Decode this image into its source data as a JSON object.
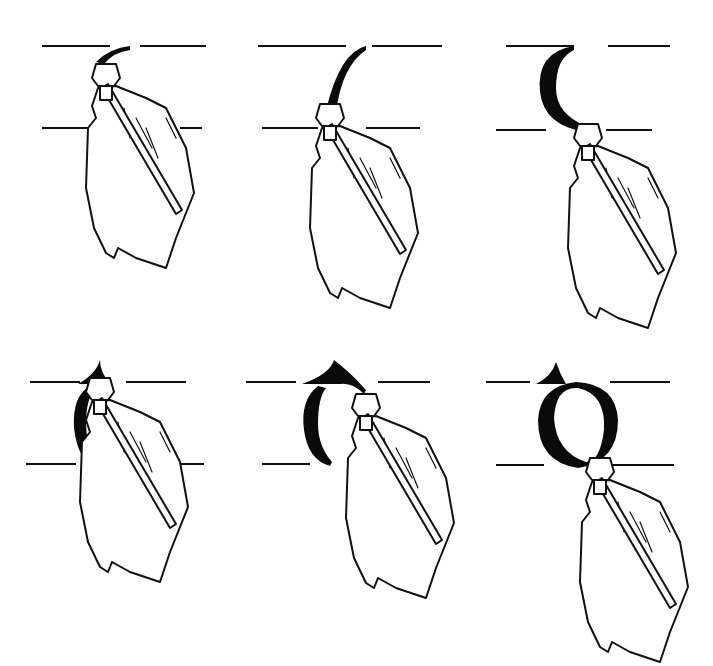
{
  "figure": {
    "type": "calligraphy-stroke-sequence",
    "letter": "o",
    "steps": [
      {
        "index": 1,
        "stage": "start-stroke-top",
        "row": 1,
        "col": 1
      },
      {
        "index": 2,
        "stage": "left-curve-half",
        "row": 1,
        "col": 2
      },
      {
        "index": 3,
        "stage": "left-curve-complete",
        "row": 1,
        "col": 3
      },
      {
        "index": 4,
        "stage": "second-stroke-start",
        "row": 2,
        "col": 1
      },
      {
        "index": 5,
        "stage": "right-curve-half",
        "row": 2,
        "col": 2
      },
      {
        "index": 6,
        "stage": "letter-complete",
        "row": 2,
        "col": 3
      }
    ],
    "colors": {
      "ink": "#0a0a0a",
      "background": "#ffffff"
    }
  }
}
